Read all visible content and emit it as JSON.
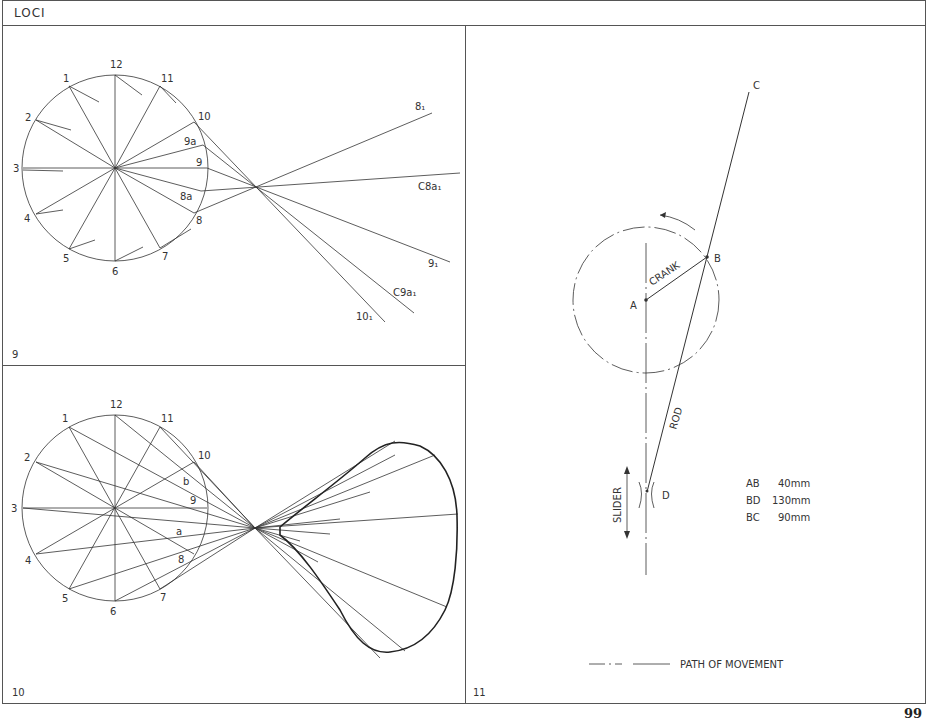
{
  "header": {
    "title": "LOCI"
  },
  "page_number": "99",
  "panels": [
    {
      "number": "9",
      "circle_labels": [
        "12",
        "1",
        "2",
        "3",
        "4",
        "5",
        "6",
        "7",
        "8",
        "9",
        "10",
        "11"
      ],
      "intermediate_labels": [
        "9a",
        "8a"
      ],
      "locus_labels": [
        "8₁",
        "C8a₁",
        "9₁",
        "C9a₁",
        "10₁"
      ]
    },
    {
      "number": "10",
      "circle_labels": [
        "12",
        "1",
        "2",
        "3",
        "4",
        "5",
        "6",
        "7",
        "8",
        "9",
        "10",
        "11"
      ],
      "intermediate_labels": [
        "b",
        "a"
      ]
    },
    {
      "number": "11",
      "point_labels": {
        "A": "A",
        "B": "B",
        "C": "C",
        "D": "D"
      },
      "member_labels": {
        "crank": "CRANK",
        "rod": "ROD",
        "slider": "SLIDER"
      },
      "dimensions": [
        {
          "name": "AB",
          "value": "40mm"
        },
        {
          "name": "BD",
          "value": "130mm"
        },
        {
          "name": "BC",
          "value": "90mm"
        }
      ],
      "legend": "PATH OF MOVEMENT"
    }
  ]
}
